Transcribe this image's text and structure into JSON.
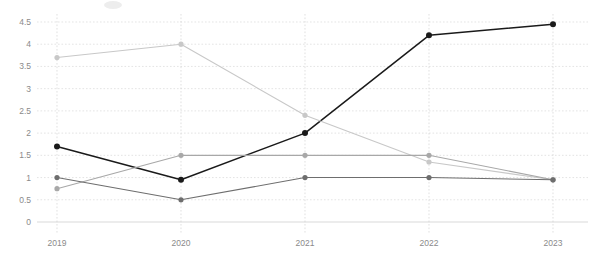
{
  "chart_data": {
    "type": "line",
    "title": "",
    "subtitle": "",
    "xlabel": "",
    "ylabel": "",
    "categories": [
      "2019",
      "2020",
      "2021",
      "2022",
      "2023"
    ],
    "ylim": [
      0,
      4.5
    ],
    "y_ticks": [
      "0",
      "0.5",
      "1",
      "1.5",
      "2",
      "2.5",
      "3",
      "3.5",
      "4",
      "4.5"
    ],
    "y_tick_values": [
      0,
      0.5,
      1,
      1.5,
      2,
      2.5,
      3,
      3.5,
      4,
      4.5
    ],
    "grid": true,
    "legend_position": "top-left",
    "series": [
      {
        "name": "series-1-dark",
        "color": "#1a1a1a",
        "values": [
          1.7,
          0.95,
          2.0,
          4.2,
          4.45
        ]
      },
      {
        "name": "series-2-light",
        "color": "#c8c8c8",
        "values": [
          3.7,
          4.0,
          2.4,
          1.35,
          0.95
        ]
      },
      {
        "name": "series-3-midgray",
        "color": "#a8a8a8",
        "values": [
          0.75,
          1.5,
          1.5,
          1.5,
          0.95
        ]
      },
      {
        "name": "series-4-darkgray",
        "color": "#6e6e6e",
        "values": [
          1.0,
          0.5,
          1.0,
          1.0,
          0.95
        ]
      }
    ]
  },
  "axis": {
    "x_labels": [
      "2019",
      "2020",
      "2021",
      "2022",
      "2023"
    ],
    "y_labels": [
      "4.5",
      "4",
      "3.5",
      "3",
      "2.5",
      "2",
      "1.5",
      "1",
      "0.5",
      "0"
    ]
  }
}
